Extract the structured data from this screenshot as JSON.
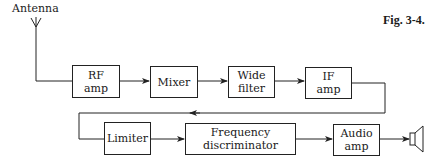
{
  "figure": {
    "label": "Fig. 3-4."
  },
  "antenna": {
    "label": "Antenna"
  },
  "blocks": [
    {
      "id": "rf-amp",
      "lines": [
        "RF",
        "amp"
      ]
    },
    {
      "id": "mixer",
      "lines": [
        "Mixer"
      ]
    },
    {
      "id": "wide-filter",
      "lines": [
        "Wide",
        "filter"
      ]
    },
    {
      "id": "if-amp",
      "lines": [
        "IF",
        "amp"
      ]
    },
    {
      "id": "limiter",
      "lines": [
        "Limiter"
      ]
    },
    {
      "id": "frequency-discriminator",
      "lines": [
        "Frequency",
        "discriminator"
      ]
    },
    {
      "id": "audio-amp",
      "lines": [
        "Audio",
        "amp"
      ]
    }
  ],
  "output": {
    "icon": "speaker-icon"
  },
  "colors": {
    "line": "#222222",
    "background": "#ffffff"
  }
}
